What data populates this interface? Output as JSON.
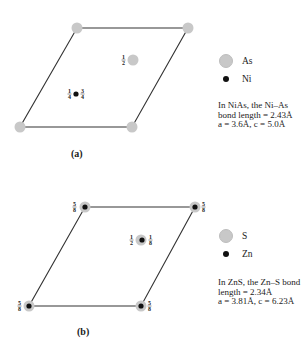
{
  "panels": [
    {
      "id": "a",
      "label": "(a)",
      "compound": "NiAs",
      "legend": [
        {
          "symbol": "large-gray-circle",
          "label": "As"
        },
        {
          "symbol": "small-black-dot",
          "label": "Ni"
        }
      ],
      "note_lines": [
        "In NiAs, the Ni–As",
        "bond length = 2.43Å",
        "a = 3.6Å, c = 5.0Å"
      ],
      "atom_fractions": {
        "center_large": "1/2",
        "ni_left": "1/4",
        "ni_right": "3/4"
      }
    },
    {
      "id": "b",
      "label": "(b)",
      "compound": "ZnS",
      "legend": [
        {
          "symbol": "large-gray-circle",
          "label": "S"
        },
        {
          "symbol": "small-black-dot",
          "label": "Zn"
        }
      ],
      "note_lines": [
        "In ZnS, the Zn–S bond",
        "length = 2.34Å",
        "a = 3.81Å, c = 6.23Å"
      ],
      "atom_fractions": {
        "corner": "5/8",
        "center_left": "1/2",
        "center_right": "1/8"
      }
    }
  ],
  "colors": {
    "large_atom": "#c8c8c8",
    "small_atom": "#111111",
    "cell_edge": "#333333"
  }
}
